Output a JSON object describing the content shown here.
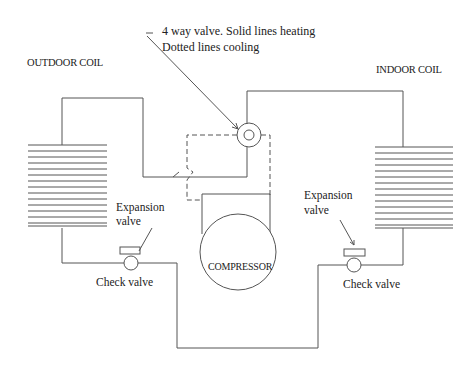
{
  "diagram": {
    "title_note": {
      "line1": "4 way valve.  Solid lines heating",
      "line2": "Dotted lines cooling"
    },
    "labels": {
      "outdoor_coil": "OUTDOOR COIL",
      "indoor_coil": "INDOOR COIL",
      "compressor": "COMPRESSOR",
      "left_expansion_valve_line1": "Expansion",
      "left_expansion_valve_line2": "valve",
      "right_expansion_valve_line1": "Expansion",
      "right_expansion_valve_line2": "valve",
      "left_check_valve": "Check valve",
      "right_check_valve": "Check valve"
    },
    "components": [
      {
        "name": "outdoor-coil",
        "fins": 14
      },
      {
        "name": "indoor-coil",
        "fins": 14
      },
      {
        "name": "four-way-valve"
      },
      {
        "name": "compressor"
      },
      {
        "name": "left-expansion-valve"
      },
      {
        "name": "right-expansion-valve"
      },
      {
        "name": "left-check-valve"
      },
      {
        "name": "right-check-valve"
      }
    ],
    "line_legend": {
      "solid": "heating",
      "dashed": "cooling"
    },
    "colors": {
      "line": "#555555",
      "text": "#222222",
      "background": "#ffffff"
    }
  }
}
